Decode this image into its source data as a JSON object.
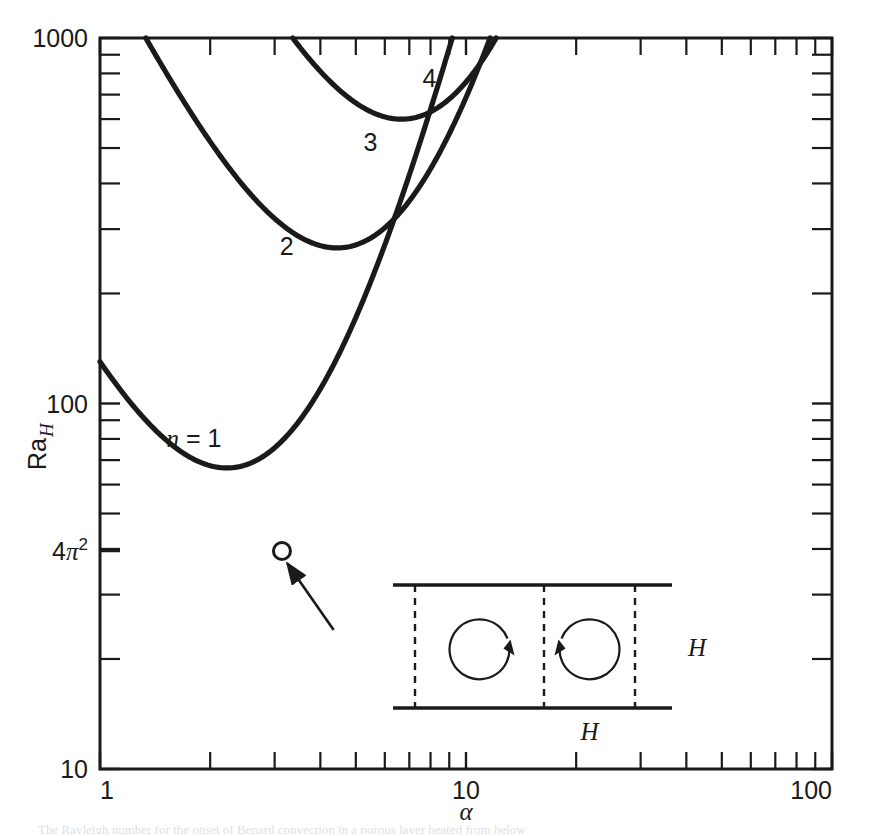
{
  "figure": {
    "title": "",
    "caption_fragment": "The Rayleigh number for the onset of Benard convection in a porous layer heated from below"
  },
  "axes": {
    "x": {
      "label": "α",
      "scale": "log",
      "min": 1,
      "max": 100,
      "tick_labels": [
        "1",
        "10",
        "100"
      ],
      "tick_values": [
        1,
        10,
        100
      ],
      "minor_ticks": [
        2,
        3,
        4,
        5,
        6,
        7,
        8,
        9,
        20,
        30,
        40,
        50,
        60,
        70,
        80,
        90
      ]
    },
    "y": {
      "label": "Ra",
      "label_subscript": "H",
      "scale": "log",
      "min": 10,
      "max": 1000,
      "tick_labels": [
        "1000",
        "100",
        "4π²",
        "10"
      ],
      "tick_values": [
        1000,
        100,
        39.478,
        10
      ],
      "special_tick": {
        "label_main": "4",
        "label_sym": "π",
        "label_sup": "2",
        "value": 39.478
      },
      "minor_ticks": [
        20,
        30,
        40,
        50,
        60,
        70,
        80,
        90,
        200,
        300,
        400,
        500,
        600,
        700,
        800,
        900
      ]
    }
  },
  "marker": {
    "name": "critical-point",
    "x": 3.1416,
    "y": 39.478,
    "style": "open-circle"
  },
  "annotation_arrow": {
    "from_x": 4.35,
    "from_y": 24.0,
    "to_x": 3.25,
    "to_y": 36.5
  },
  "inset": {
    "name": "convection-rolls-diagram",
    "label_height": "H",
    "label_width": "H",
    "roll_count": 2,
    "rotation_left": "clockwise",
    "rotation_right": "counterclockwise"
  },
  "curve_labels": [
    {
      "text_prefix": "n",
      "text_rest": " = 1",
      "x": 1.52,
      "y": 76.0
    },
    {
      "text_prefix": "",
      "text_rest": "2",
      "x": 3.1,
      "y": 255.0
    },
    {
      "text_prefix": "",
      "text_rest": "3",
      "x": 5.25,
      "y": 490.0
    },
    {
      "text_prefix": "",
      "text_rest": "4",
      "x": 7.6,
      "y": 735.0
    }
  ],
  "chart_data": {
    "type": "line",
    "title": "",
    "xlabel": "α",
    "ylabel": "Ra_H",
    "xscale": "log",
    "yscale": "log",
    "xlim": [
      1,
      100
    ],
    "ylim": [
      10,
      1000
    ],
    "grid": false,
    "legend": "inline-curve-labels",
    "annotations": [
      {
        "text": "4π²",
        "x": 3.1416,
        "y": 39.478,
        "type": "axis-tick"
      },
      {
        "text": "open circle marker at minimum of n=1 curve",
        "x": 3.1416,
        "y": 39.478
      }
    ],
    "series": [
      {
        "name": "n = 1",
        "n": 1,
        "formula": "Ra_H = (n^2*pi^2 + alpha^2)^3 / (n^2*pi^2*alpha^2)",
        "minimum": {
          "x": 3.1416,
          "y": 39.478
        },
        "x": [
          1.0,
          1.15,
          1.3,
          1.5,
          1.75,
          2.0,
          2.3,
          2.6,
          3.0,
          3.1416,
          3.4,
          3.8,
          4.3,
          5.0,
          5.8,
          6.6,
          7.5,
          8.5,
          9.6,
          11.0,
          12.5,
          14.0,
          16.0,
          18.0,
          20.0,
          22.5,
          25.0,
          27.0,
          28.5
        ],
        "y": [
          131.4,
          104.6,
          87.2,
          72.8,
          61.6,
          55.1,
          49.8,
          46.3,
          43.0,
          39.478,
          40.0,
          41.2,
          43.6,
          48.3,
          56.6,
          67.2,
          81.9,
          101.0,
          127.8,
          172.3,
          233.1,
          309.0,
          432.0,
          589.0,
          785.0,
          1079.0,
          1429.0,
          1752.0,
          1974.0
        ]
      },
      {
        "name": "2",
        "n": 2,
        "minimum": {
          "x": 6.283,
          "y": 157.9
        },
        "x": [
          1.9,
          2.2,
          2.6,
          3.0,
          3.5,
          4.0,
          4.6,
          5.2,
          6.0,
          6.283,
          7.0,
          8.0,
          9.0,
          10.2,
          11.5,
          13.0,
          15.0,
          17.0,
          19.5,
          22.0,
          25.0,
          27.5,
          29.5
        ],
        "y": [
          1000.0,
          820.0,
          650.0,
          543.0,
          443.0,
          381.0,
          327.0,
          292.0,
          259.0,
          157.9,
          251.0,
          263.0,
          284.0,
          317.0,
          364.0,
          441.0,
          578.0,
          760.0,
          1048.0,
          1415.0,
          1994.0,
          2600.0,
          3150.0
        ]
      },
      {
        "name": "3",
        "n": 3,
        "minimum": {
          "x": 9.425,
          "y": 355.3
        },
        "x": [
          3.0,
          3.4,
          3.9,
          4.5,
          5.2,
          6.0,
          7.0,
          8.0,
          9.0,
          9.425,
          10.5,
          12.0,
          13.5,
          15.5,
          17.5,
          20.0,
          22.5,
          25.5,
          28.5,
          30.5
        ],
        "y": [
          1000.0,
          880.0,
          760.0,
          660.0,
          578.0,
          512.0,
          455.0,
          420.0,
          400.0,
          355.3,
          398.0,
          413.0,
          442.0,
          498.0,
          575.0,
          700.0,
          860.0,
          1110.0,
          1440.0,
          1720.0
        ]
      },
      {
        "name": "4",
        "n": 4,
        "minimum": {
          "x": 12.566,
          "y": 631.7
        },
        "x": [
          4.2,
          4.8,
          5.5,
          6.3,
          7.2,
          8.2,
          9.4,
          10.6,
          12.0,
          12.566,
          13.5,
          15.0,
          17.0,
          19.0,
          21.5,
          24.0,
          27.0,
          30.0,
          31.5
        ],
        "y": [
          1000.0,
          930.0,
          860.0,
          800.0,
          750.0,
          710.0,
          680.0,
          660.0,
          648.0,
          631.7,
          650.0,
          665.0,
          700.0,
          750.0,
          835.0,
          940.0,
          1110.0,
          1310.0,
          1430.0
        ]
      }
    ]
  }
}
